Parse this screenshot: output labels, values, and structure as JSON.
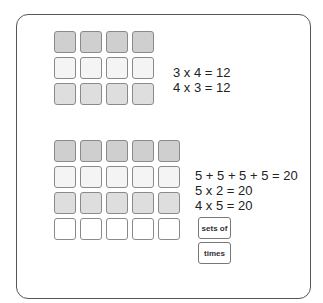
{
  "diagram": {
    "array_one": {
      "rows": 3,
      "columns": 4,
      "row_shades": [
        "dark",
        "light",
        "mid"
      ],
      "equations": [
        "3 x 4 = 12",
        "4 x 3 = 12"
      ]
    },
    "array_two": {
      "rows": 4,
      "columns": 5,
      "row_shades": [
        "dark",
        "light",
        "mid",
        "white"
      ],
      "equations": [
        "5 + 5 + 5 + 5 = 20",
        "5 x 2 = 20",
        "4 x 5 = 20"
      ],
      "word_cards": [
        "sets of",
        "times"
      ]
    },
    "colors": {
      "dark_square": "#cfcfcf",
      "light_square": "#f4f4f4",
      "mid_square": "#dedede",
      "white_square": "#ffffff",
      "border": "#555555"
    }
  }
}
